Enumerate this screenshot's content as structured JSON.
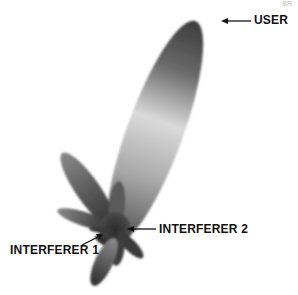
{
  "figure": {
    "page_marker": "BR",
    "labels": {
      "user": "USER",
      "interferer_1": "INTERFERER 1",
      "interferer_2": "INTERFERER 2"
    },
    "colors": {
      "lobe_dark": "#3a3a3a",
      "lobe_light": "#d8d8d8",
      "text": "#111111",
      "background": "#ffffff"
    }
  }
}
